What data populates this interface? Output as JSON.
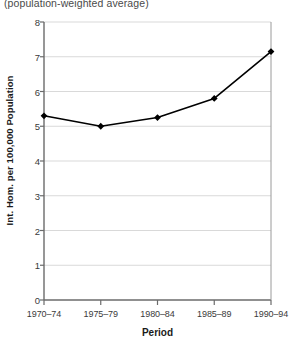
{
  "caption": "(population-weighted average)",
  "chart_data": {
    "type": "line",
    "title": "(population-weighted average)",
    "xlabel": "Period",
    "ylabel": "Int. Hom. per 100,000 Population",
    "categories": [
      "1970–74",
      "1975–79",
      "1980–84",
      "1985–89",
      "1990–94"
    ],
    "values": [
      5.3,
      5.0,
      5.25,
      5.8,
      7.15
    ],
    "ylim": [
      0,
      8
    ],
    "yticks": [
      0,
      1,
      2,
      3,
      4,
      5,
      6,
      7,
      8
    ],
    "ytick_labels": [
      "0",
      "1",
      "2",
      "3",
      "4",
      "5",
      "6",
      "7",
      "8"
    ],
    "grid": true,
    "grid_axis": "y",
    "grid_color": "#d9d9d9",
    "legend": null,
    "series_color": "#000000",
    "marker": "diamond",
    "line_width": 1.6
  },
  "colors": {
    "line": "#000000",
    "marker": "#000000",
    "grid": "#d9d9d9",
    "axis": "#6b6b6b",
    "text": "#231f20"
  }
}
